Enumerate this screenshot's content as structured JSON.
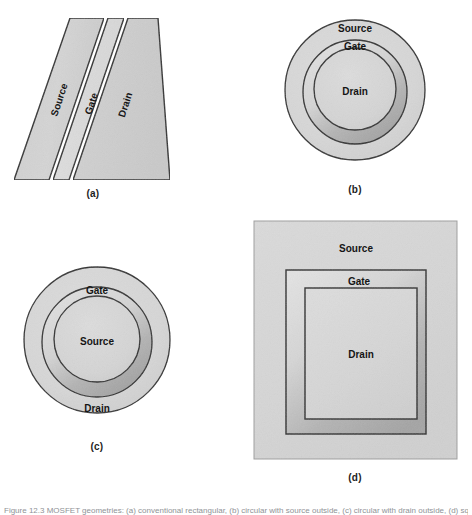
{
  "figure": {
    "background_color": "#ffffff",
    "caption_bottom": "Figure 12.3 MOSFET geometries: (a) conventional rectangular, (b) circular with source outside, (c) circular with drain outside, (d) square annular.",
    "fill_light": "#d2d2d2",
    "fill_lighter": "#dcdcdc",
    "fill_shadow": "#a9a9a9",
    "stroke_color": "#2a2a2a",
    "label_color": "#151515"
  },
  "panels": [
    {
      "id": "a",
      "caption": "(a)",
      "type": "parallelogram-planar",
      "regions": [
        {
          "name": "source",
          "label": "Source",
          "rotation": -72
        },
        {
          "name": "gate",
          "label": "Gate",
          "rotation": -72
        },
        {
          "name": "drain",
          "label": "Drain",
          "rotation": -72
        }
      ]
    },
    {
      "id": "b",
      "caption": "(b)",
      "type": "concentric-circles",
      "regions": [
        {
          "name": "source",
          "label": "Source",
          "position": "outer-ring"
        },
        {
          "name": "gate",
          "label": "Gate",
          "position": "middle-ring"
        },
        {
          "name": "drain",
          "label": "Drain",
          "position": "center"
        }
      ]
    },
    {
      "id": "c",
      "caption": "(c)",
      "type": "concentric-circles",
      "regions": [
        {
          "name": "gate",
          "label": "Gate",
          "position": "middle-ring"
        },
        {
          "name": "source",
          "label": "Source",
          "position": "center"
        },
        {
          "name": "drain",
          "label": "Drain",
          "position": "outer-ring"
        }
      ]
    },
    {
      "id": "d",
      "caption": "(d)",
      "type": "concentric-squares",
      "regions": [
        {
          "name": "source",
          "label": "Source",
          "position": "outer-ring"
        },
        {
          "name": "gate",
          "label": "Gate",
          "position": "middle-ring"
        },
        {
          "name": "drain",
          "label": "Drain",
          "position": "center"
        }
      ]
    }
  ]
}
